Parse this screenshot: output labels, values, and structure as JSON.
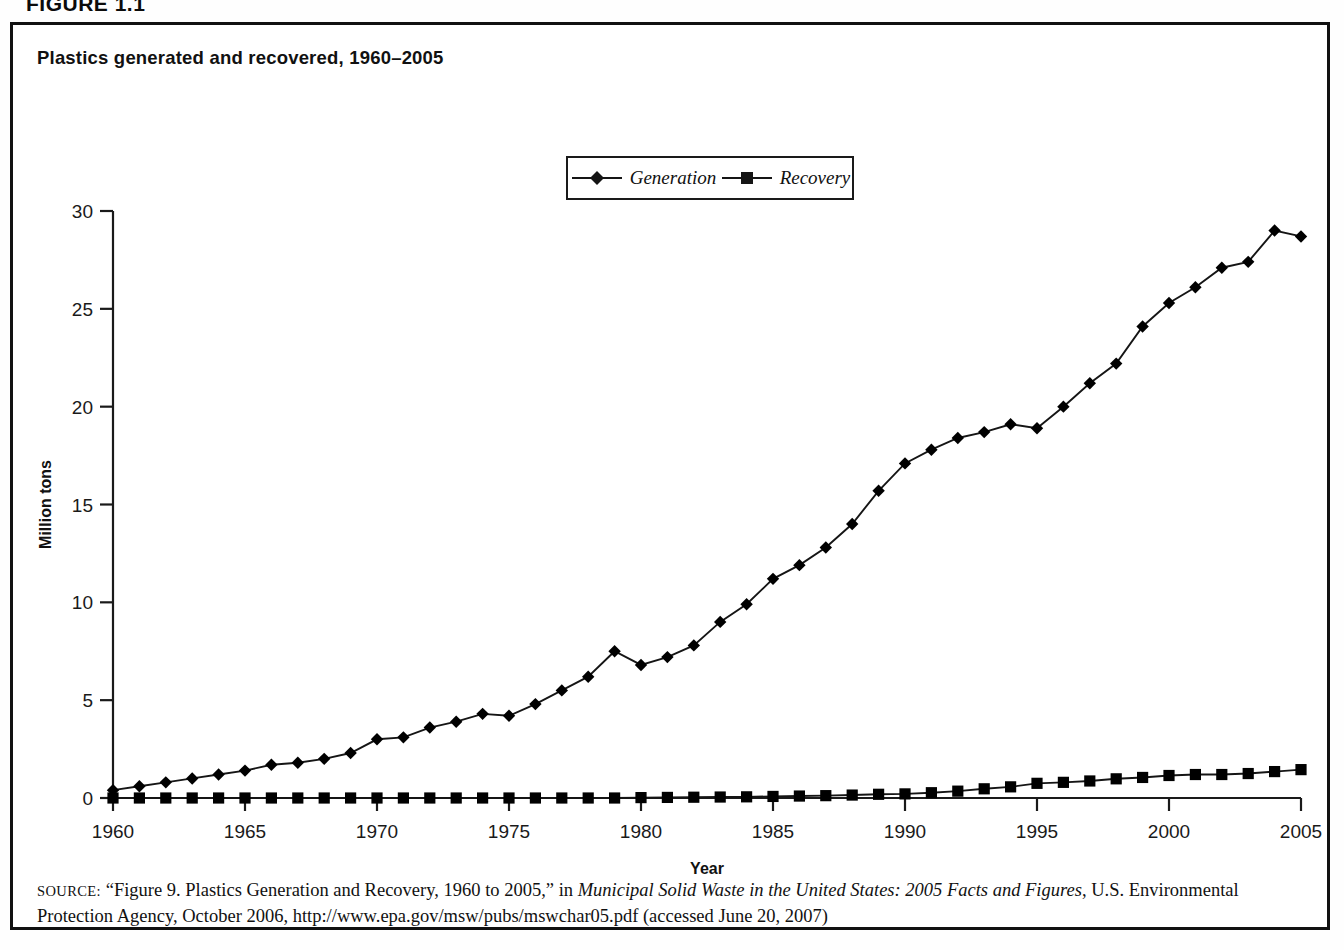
{
  "figure": {
    "label": "FIGURE 1.1",
    "corner_right": ""
  },
  "chart_title": "Plastics generated and recovered, 1960–2005",
  "legend": {
    "items": [
      {
        "label": "Generation",
        "marker": "diamond",
        "color": "#151515"
      },
      {
        "label": "Recovery",
        "marker": "square",
        "color": "#151515"
      }
    ]
  },
  "axes": {
    "ylabel": "Million tons",
    "xlabel": "Year",
    "ytick_labels": [
      "0",
      "5",
      "10",
      "15",
      "20",
      "25",
      "30"
    ],
    "xtick_labels": [
      "1960",
      "1965",
      "1970",
      "1975",
      "1980",
      "1985",
      "1990",
      "1995",
      "2000",
      "2005"
    ]
  },
  "source": {
    "prefix": "SOURCE:",
    "part1": " “Figure 9. Plastics Generation and Recovery, 1960 to 2005,” in ",
    "italic1": "Municipal Solid Waste in the United States: 2005 Facts and Figures",
    "part2": ", U.S. Environmental Protection Agency, October 2006, http://www.epa.gov/msw/pubs/mswchar05.pdf (accessed June 20, 2007)"
  },
  "chart_data": {
    "type": "line",
    "title": "Plastics generated and recovered, 1960–2005",
    "xlabel": "Year",
    "ylabel": "Million tons",
    "xlim": [
      1960,
      2005
    ],
    "ylim": [
      0,
      30
    ],
    "ytick_values": [
      0,
      5,
      10,
      15,
      20,
      25,
      30
    ],
    "xtick_values": [
      1960,
      1965,
      1970,
      1975,
      1980,
      1985,
      1990,
      1995,
      2000,
      2005
    ],
    "grid": false,
    "legend_position": "top-center",
    "x": [
      1960,
      1961,
      1962,
      1963,
      1964,
      1965,
      1966,
      1967,
      1968,
      1969,
      1970,
      1971,
      1972,
      1973,
      1974,
      1975,
      1976,
      1977,
      1978,
      1979,
      1980,
      1981,
      1982,
      1983,
      1984,
      1985,
      1986,
      1987,
      1988,
      1989,
      1990,
      1991,
      1992,
      1993,
      1994,
      1995,
      1996,
      1997,
      1998,
      1999,
      2000,
      2001,
      2002,
      2003,
      2004,
      2005
    ],
    "series": [
      {
        "name": "Generation",
        "marker": "diamond",
        "values": [
          0.4,
          0.6,
          0.8,
          1.0,
          1.2,
          1.4,
          1.7,
          1.8,
          2.0,
          2.3,
          3.0,
          3.1,
          3.6,
          3.9,
          4.3,
          4.2,
          4.8,
          5.5,
          6.2,
          7.5,
          6.8,
          7.2,
          7.8,
          9.0,
          9.9,
          11.2,
          11.9,
          12.8,
          14.0,
          15.7,
          17.1,
          17.8,
          18.4,
          18.7,
          19.1,
          18.9,
          20.0,
          21.2,
          22.2,
          24.1,
          25.3,
          26.1,
          27.1,
          27.4,
          29.0,
          28.7
        ]
      },
      {
        "name": "Recovery",
        "marker": "square",
        "values": [
          0.0,
          0.0,
          0.0,
          0.0,
          0.0,
          0.0,
          0.0,
          0.0,
          0.0,
          0.0,
          0.0,
          0.0,
          0.0,
          0.0,
          0.0,
          0.0,
          0.0,
          0.0,
          0.0,
          0.0,
          0.02,
          0.03,
          0.04,
          0.05,
          0.06,
          0.08,
          0.1,
          0.12,
          0.15,
          0.19,
          0.21,
          0.27,
          0.35,
          0.47,
          0.57,
          0.75,
          0.8,
          0.87,
          0.98,
          1.05,
          1.15,
          1.2,
          1.2,
          1.25,
          1.35,
          1.45
        ]
      }
    ]
  }
}
